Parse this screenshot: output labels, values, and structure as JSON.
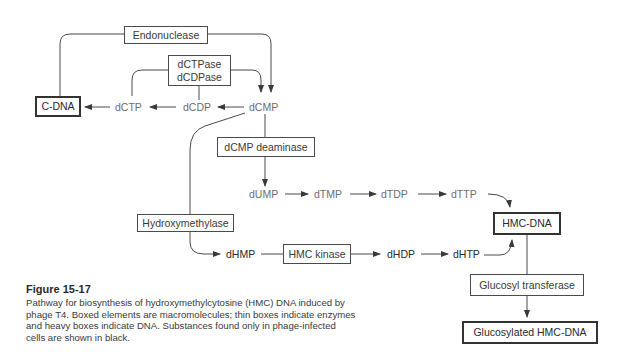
{
  "figure": {
    "title": "Figure 15-17",
    "caption": "Pathway for biosynthesis of hydroxymethylcytosine (HMC) DNA induced by phage T4. Boxed elements are macromolecules; thin boxes indicate enzymes and heavy boxes indicate DNA. Substances found only in phage-infected cells are shown in black."
  },
  "enzymes": {
    "endonuclease": "Endonuclease",
    "dctpase": "dCTPase",
    "dcdpase": "dCDPase",
    "dcmp_deaminase": "dCMP deaminase",
    "hydroxymethylase": "Hydroxymethylase",
    "hmc_kinase": "HMC kinase",
    "glucosyl_transferase": "Glucosyl transferase"
  },
  "dna": {
    "c_dna": "C-DNA",
    "hmc_dna": "HMC-DNA",
    "glucosylated_hmc_dna": "Glucosylated HMC-DNA"
  },
  "metabolites": {
    "dctp": "dCTP",
    "dcdp": "dCDP",
    "dcmp": "dCMP",
    "dump": "dUMP",
    "dtmp": "dTMP",
    "dtdp": "dTDP",
    "dttp": "dTTP",
    "dhmp": "dHMP",
    "dhdp": "dHDP",
    "dhtp": "dHTP"
  },
  "colors": {
    "host_substance": "#6e6e6e",
    "phage_only_substance": "#2a2a2a",
    "line": "#4a4a4a",
    "background": "#ffffff"
  }
}
